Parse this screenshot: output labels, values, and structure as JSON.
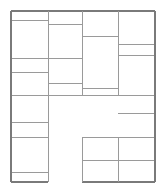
{
  "figure": {
    "width": 166,
    "height": 193,
    "background_color": "#ffffff",
    "line_color": "#7a7a7a",
    "line_color_light": "#9a9a9a",
    "outer_line_width": 1.3,
    "inner_line_width": 1.0
  },
  "grid": {
    "outer_left": 11,
    "outer_top": 11,
    "outer_right": 155,
    "outer_bottom": 182,
    "column_dividers": [
      48,
      82,
      118
    ],
    "columns": [
      {
        "name": "column-1",
        "x0": 11,
        "x1": 48
      },
      {
        "name": "column-2",
        "x0": 48,
        "x1": 82
      },
      {
        "name": "column-3",
        "x0": 82,
        "x1": 118
      },
      {
        "name": "column-4",
        "x0": 118,
        "x1": 155
      }
    ]
  },
  "cells": [
    {
      "name": "cell-c1-r1",
      "column": 1,
      "row": 1,
      "x": 11,
      "y": 11,
      "w": 37,
      "h": 9
    },
    {
      "name": "cell-c1-r2",
      "column": 1,
      "row": 2,
      "x": 11,
      "y": 20,
      "w": 37,
      "h": 38
    },
    {
      "name": "cell-c1-r3",
      "column": 1,
      "row": 3,
      "x": 11,
      "y": 58,
      "w": 37,
      "h": 14
    },
    {
      "name": "cell-c1-r4",
      "column": 1,
      "row": 4,
      "x": 11,
      "y": 72,
      "w": 37,
      "h": 23
    },
    {
      "name": "cell-c1-r5",
      "column": 1,
      "row": 5,
      "x": 11,
      "y": 95,
      "w": 37,
      "h": 27
    },
    {
      "name": "cell-c1-r6",
      "column": 1,
      "row": 6,
      "x": 11,
      "y": 122,
      "w": 37,
      "h": 15
    },
    {
      "name": "cell-c1-r7",
      "column": 1,
      "row": 7,
      "x": 11,
      "y": 137,
      "w": 37,
      "h": 35
    },
    {
      "name": "cell-c1-r8",
      "column": 1,
      "row": 8,
      "x": 11,
      "y": 172,
      "w": 37,
      "h": 10
    },
    {
      "name": "cell-c2-r1",
      "column": 2,
      "row": 1,
      "x": 48,
      "y": 11,
      "w": 34,
      "h": 13
    },
    {
      "name": "cell-c2-r2",
      "column": 2,
      "row": 2,
      "x": 48,
      "y": 24,
      "w": 34,
      "h": 34
    },
    {
      "name": "cell-c2-r3",
      "column": 2,
      "row": 3,
      "x": 48,
      "y": 58,
      "w": 34,
      "h": 25
    },
    {
      "name": "cell-c2-r4",
      "column": 2,
      "row": 4,
      "x": 48,
      "y": 83,
      "w": 34,
      "h": 12
    },
    {
      "name": "cell-c3-r1",
      "column": 3,
      "row": 1,
      "x": 82,
      "y": 11,
      "w": 36,
      "h": 25
    },
    {
      "name": "cell-c3-r2",
      "column": 3,
      "row": 2,
      "x": 82,
      "y": 36,
      "w": 36,
      "h": 52
    },
    {
      "name": "cell-c3-r3",
      "column": 3,
      "row": 3,
      "x": 82,
      "y": 88,
      "w": 36,
      "h": 7
    },
    {
      "name": "cell-c4-r1",
      "column": 4,
      "row": 1,
      "x": 118,
      "y": 11,
      "w": 37,
      "h": 33
    },
    {
      "name": "cell-c4-r2",
      "column": 4,
      "row": 2,
      "x": 118,
      "y": 44,
      "w": 37,
      "h": 11
    },
    {
      "name": "cell-c4-r3",
      "column": 4,
      "row": 3,
      "x": 118,
      "y": 55,
      "w": 37,
      "h": 40
    },
    {
      "name": "cell-c4-r4",
      "column": 4,
      "row": 4,
      "x": 118,
      "y": 95,
      "w": 37,
      "h": 18
    },
    {
      "name": "cell-c4-r5",
      "column": 4,
      "row": 5,
      "x": 118,
      "y": 113,
      "w": 37,
      "h": 24
    },
    {
      "name": "cell-c4-r6",
      "column": 4,
      "row": 6,
      "x": 118,
      "y": 137,
      "w": 37,
      "h": 23
    },
    {
      "name": "cell-c4-r7",
      "column": 4,
      "row": 7,
      "x": 118,
      "y": 160,
      "w": 37,
      "h": 22
    },
    {
      "name": "cell-bottom-mid-upper",
      "column": 3,
      "row": 4,
      "x": 82,
      "y": 137,
      "w": 36,
      "h": 23
    },
    {
      "name": "cell-bottom-mid-lower",
      "column": 3,
      "row": 5,
      "x": 82,
      "y": 160,
      "w": 36,
      "h": 22
    }
  ],
  "void_regions": [
    {
      "name": "central-void",
      "x": 48,
      "y": 95,
      "w": 70,
      "h": 42
    },
    {
      "name": "bottom-gap",
      "x": 48,
      "y": 137,
      "w": 34,
      "h": 45
    }
  ],
  "segments": {
    "horizontal": [
      {
        "name": "h-outer-top",
        "x1": 11,
        "x2": 155,
        "y": 11,
        "weight": "outer"
      },
      {
        "name": "h-c1-r1-bottom",
        "x1": 11,
        "x2": 48,
        "y": 20,
        "weight": "inner"
      },
      {
        "name": "h-c2-r1-bottom",
        "x1": 48,
        "x2": 82,
        "y": 24,
        "weight": "inner"
      },
      {
        "name": "h-c3-r1-bottom",
        "x1": 82,
        "x2": 118,
        "y": 36,
        "weight": "inner"
      },
      {
        "name": "h-c4-r1-bottom",
        "x1": 118,
        "x2": 155,
        "y": 44,
        "weight": "inner"
      },
      {
        "name": "h-c4-r2-bottom",
        "x1": 118,
        "x2": 155,
        "y": 55,
        "weight": "inner"
      },
      {
        "name": "h-c1-c2-mid",
        "x1": 11,
        "x2": 82,
        "y": 58,
        "weight": "inner"
      },
      {
        "name": "h-c1-r3-bottom",
        "x1": 11,
        "x2": 48,
        "y": 72,
        "weight": "inner"
      },
      {
        "name": "h-c2-r3-bottom",
        "x1": 48,
        "x2": 82,
        "y": 83,
        "weight": "inner"
      },
      {
        "name": "h-c3-r2-bottom",
        "x1": 82,
        "x2": 118,
        "y": 88,
        "weight": "inner"
      },
      {
        "name": "h-mid-band",
        "x1": 11,
        "x2": 155,
        "y": 95,
        "weight": "inner"
      },
      {
        "name": "h-c4-r4-bottom",
        "x1": 118,
        "x2": 155,
        "y": 113,
        "weight": "inner"
      },
      {
        "name": "h-c1-r5-bottom",
        "x1": 11,
        "x2": 48,
        "y": 122,
        "weight": "inner"
      },
      {
        "name": "h-c1-r6-bottom",
        "x1": 11,
        "x2": 48,
        "y": 137,
        "weight": "inner"
      },
      {
        "name": "h-bottom-mid-top",
        "x1": 82,
        "x2": 155,
        "y": 137,
        "weight": "inner"
      },
      {
        "name": "h-bottom-mid-divider",
        "x1": 82,
        "x2": 155,
        "y": 160,
        "weight": "inner"
      },
      {
        "name": "h-c1-r7-bottom",
        "x1": 11,
        "x2": 48,
        "y": 172,
        "weight": "inner"
      },
      {
        "name": "h-outer-bottom-left",
        "x1": 11,
        "x2": 48,
        "y": 182,
        "weight": "outer"
      },
      {
        "name": "h-outer-bottom-right",
        "x1": 82,
        "x2": 155,
        "y": 182,
        "weight": "outer"
      }
    ],
    "vertical": [
      {
        "name": "v-outer-left",
        "y1": 11,
        "y2": 182,
        "x": 11,
        "weight": "outer"
      },
      {
        "name": "v-col1-col2",
        "y1": 11,
        "y2": 182,
        "x": 48,
        "weight": "inner"
      },
      {
        "name": "v-col2-col3",
        "y1": 11,
        "y2": 95,
        "x": 82,
        "weight": "inner"
      },
      {
        "name": "v-col2-col3-lower",
        "y1": 137,
        "y2": 182,
        "x": 82,
        "weight": "inner"
      },
      {
        "name": "v-col3-col4",
        "y1": 11,
        "y2": 95,
        "x": 118,
        "weight": "inner"
      },
      {
        "name": "v-col3-col4-lower",
        "y1": 137,
        "y2": 182,
        "x": 118,
        "weight": "inner"
      },
      {
        "name": "v-outer-right",
        "y1": 11,
        "y2": 182,
        "x": 155,
        "weight": "outer"
      }
    ]
  }
}
